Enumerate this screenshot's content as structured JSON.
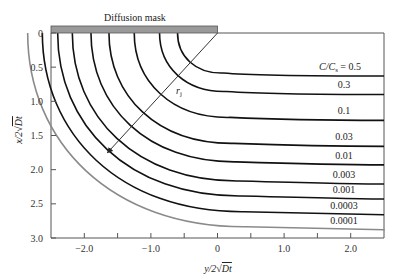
{
  "chart_data": {
    "type": "line",
    "title": "",
    "mask_label": "Diffusion mask",
    "xlabel": "y/2√Dt",
    "ylabel": "x/2√Dt",
    "xlim": [
      -2.5,
      2.5
    ],
    "ylim": [
      0,
      3.0
    ],
    "y_inverted": true,
    "x_ticks": [
      -2.0,
      -1.5,
      -1.0,
      -0.5,
      0,
      0.5,
      1.0,
      1.5,
      2.0
    ],
    "x_tick_labels": [
      "−2.0",
      "−1.0",
      "0",
      "1.0",
      "2.0"
    ],
    "x_tick_label_values": [
      -2.0,
      -1.0,
      0,
      1.0,
      2.0
    ],
    "y_ticks": [
      0,
      0.5,
      1.0,
      1.5,
      2.0,
      2.5,
      3.0
    ],
    "y_tick_labels": [
      "0",
      "0.5",
      "1.0",
      "1.5",
      "2.0",
      "2.5",
      "3.0"
    ],
    "legend_title": "C/Cₛ",
    "series": [
      {
        "name": "C/Cs = 0.5",
        "label": "C/Cₛ = 0.5",
        "depth": 0.6,
        "color": "#111111"
      },
      {
        "name": "0.3",
        "label": "0.3",
        "depth": 0.87,
        "color": "#111111"
      },
      {
        "name": "0.1",
        "label": "0.1",
        "depth": 1.25,
        "color": "#111111"
      },
      {
        "name": "0.03",
        "label": "0.03",
        "depth": 1.63,
        "color": "#111111"
      },
      {
        "name": "0.01",
        "label": "0.01",
        "depth": 1.9,
        "color": "#111111"
      },
      {
        "name": "0.003",
        "label": "0.003",
        "depth": 2.18,
        "color": "#111111"
      },
      {
        "name": "0.001",
        "label": "0.001",
        "depth": 2.4,
        "color": "#111111"
      },
      {
        "name": "0.0003",
        "label": "0.0003",
        "depth": 2.63,
        "color": "#111111"
      },
      {
        "name": "0.0001",
        "label": "0.0001",
        "depth": 2.85,
        "color": "#8a8a8a"
      }
    ],
    "annotations": [
      {
        "text": "rⱼ",
        "display": "r",
        "subscript": "j",
        "type": "radius-arrow",
        "from": [
          0,
          0
        ],
        "to": [
          -1.65,
          1.75
        ]
      }
    ],
    "mask": {
      "x_from": -2.5,
      "x_to": 0,
      "color": "#9a9a9a"
    },
    "grid": false,
    "legend_position": "inline-right"
  }
}
